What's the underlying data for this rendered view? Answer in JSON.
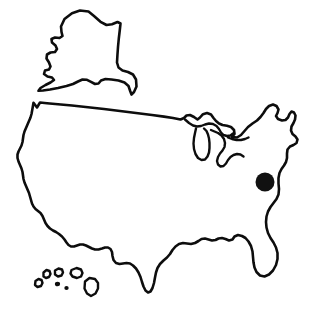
{
  "figure": {
    "title": "United States outline map",
    "width": 310,
    "height": 320,
    "background_color": "#ffffff",
    "outline_color": "#0d0d0d",
    "marker_color": "#111111",
    "style": "hand-drawn line art, no fill, no labels"
  },
  "regions": [
    {
      "name": "contiguous-united-states",
      "label": "Contiguous United States",
      "position": "center and lower portion of image"
    },
    {
      "name": "alaska",
      "label": "Alaska",
      "position": "upper left, drawn above the mainland, not to scale"
    },
    {
      "name": "great-lakes",
      "label": "Great Lakes",
      "position": "upper right of mainland"
    },
    {
      "name": "hawaii",
      "label": "Hawaiian Islands",
      "position": "lower left, below mainland"
    }
  ],
  "markers": [
    {
      "name": "location-marker",
      "label": "Location marker",
      "shape": "filled circle",
      "color": "#111111",
      "center_x": 265,
      "center_y": 182,
      "radius": 9.5,
      "approximate_area": "mid-Atlantic coast region"
    }
  ],
  "legend": {
    "present": false,
    "entries": []
  },
  "labels": {
    "present": false,
    "entries": []
  }
}
